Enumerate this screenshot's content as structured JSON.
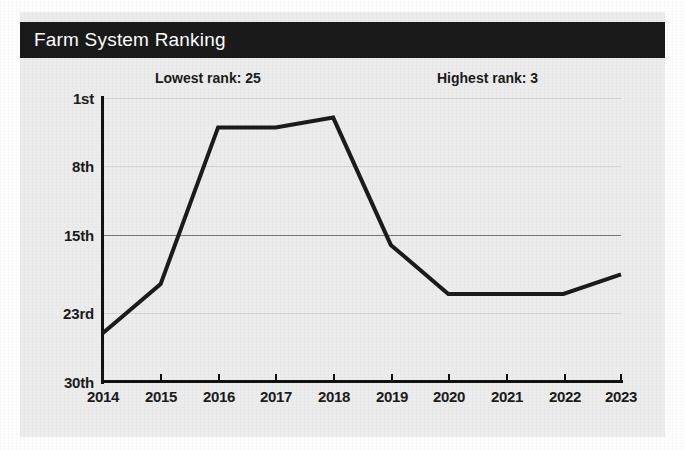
{
  "card": {
    "title": "Farm System Ranking"
  },
  "annotations": {
    "lowest": "Lowest rank: 25",
    "highest": "Highest rank: 3"
  },
  "colors": {
    "titlebar_bg": "#1a1a1a",
    "title_text": "#ffffff",
    "card_bg": "#ececec",
    "line": "#1b1b1b",
    "gridline": "#d2d2d2",
    "gridline_major": "#777777",
    "axis": "#111111"
  },
  "chart_data": {
    "type": "line",
    "title": "Farm System Ranking",
    "xlabel": "",
    "ylabel": "",
    "x": [
      "2014",
      "2015",
      "2016",
      "2017",
      "2018",
      "2019",
      "2020",
      "2021",
      "2022",
      "2023"
    ],
    "values": [
      25,
      20,
      4,
      4,
      3,
      16,
      21,
      21,
      21,
      19
    ],
    "ytick_labels": [
      "1st",
      "8th",
      "15th",
      "23rd",
      "30th"
    ],
    "ytick_values": [
      1,
      8,
      15,
      23,
      30
    ],
    "ylim": [
      1,
      30
    ],
    "y_inverted": true,
    "grid": true,
    "legend": "none",
    "annotations": [
      "Lowest rank: 25",
      "Highest rank: 3"
    ]
  }
}
